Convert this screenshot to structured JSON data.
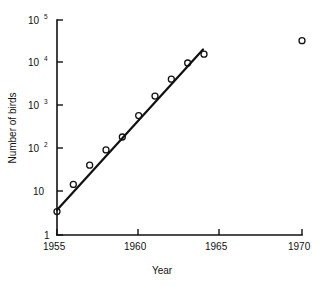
{
  "chart_data": {
    "type": "scatter",
    "title": "",
    "xlabel": "Year",
    "ylabel": "Number of birds",
    "xlim": [
      1955,
      1970
    ],
    "ylim": [
      1,
      100000
    ],
    "yscale": "log",
    "xscale": "linear",
    "grid": false,
    "legend": null,
    "x_ticks": [
      "1955",
      "1960",
      "1965",
      "1970"
    ],
    "x_tick_values": [
      1955,
      1960,
      1965,
      1970
    ],
    "y_ticks": [
      "1",
      "10",
      "10 2",
      "10 3",
      "10 4",
      "10 5"
    ],
    "y_tick_values": [
      1,
      10,
      100,
      1000,
      10000,
      100000
    ],
    "y_tick_labels": [
      {
        "base": "1",
        "exp": ""
      },
      {
        "base": "10",
        "exp": ""
      },
      {
        "base": "10",
        "exp": "2"
      },
      {
        "base": "10",
        "exp": "3"
      },
      {
        "base": "10",
        "exp": "4"
      },
      {
        "base": "10",
        "exp": "5"
      }
    ],
    "series": [
      {
        "name": "Number of birds",
        "marker": "open-circle",
        "x": [
          1955,
          1956,
          1957,
          1958,
          1959,
          1960,
          1961,
          1962,
          1963,
          1964
        ],
        "y": [
          3.5,
          15,
          42,
          95,
          190,
          600,
          1700,
          4200,
          10000,
          16000
        ]
      },
      {
        "name": "Outlier 1970",
        "marker": "open-circle",
        "x": [
          1970
        ],
        "y": [
          33000
        ]
      }
    ],
    "trend_line": {
      "name": "fitted exponential growth line",
      "x_start": 1955,
      "y_start": 4.0,
      "x_end": 1964.0,
      "y_end": 21000
    },
    "annotations": []
  }
}
